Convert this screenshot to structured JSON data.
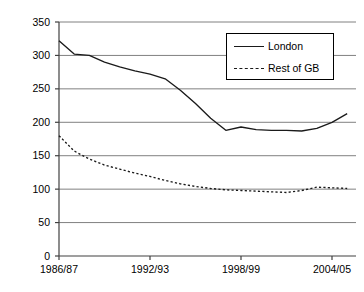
{
  "chart_data": {
    "type": "line",
    "title": "",
    "xlabel": "",
    "ylabel": "Cost per Bus Kilometre, 2006/07 prices",
    "ylim": [
      0,
      350
    ],
    "ytick_values": [
      0,
      50,
      100,
      150,
      200,
      250,
      300,
      350
    ],
    "ytick_labels": [
      "0",
      "50",
      "100",
      "150",
      "200",
      "250",
      "300",
      "350"
    ],
    "x": [
      "1986/87",
      "1987/88",
      "1988/89",
      "1989/90",
      "1990/91",
      "1991/92",
      "1992/93",
      "1993/94",
      "1994/95",
      "1995/96",
      "1996/97",
      "1997/98",
      "1998/99",
      "1999/00",
      "2000/01",
      "2001/02",
      "2002/03",
      "2003/04",
      "2004/05",
      "2005/06"
    ],
    "xtick_labels": [
      "1986/87",
      "1992/93",
      "1998/99",
      "2004/05"
    ],
    "xtick_indices": [
      0,
      6,
      12,
      18
    ],
    "grid": true,
    "grid_axis": "y",
    "legend_position": "top-right",
    "series": [
      {
        "name": "London",
        "style": "solid",
        "color": "#1a1a1a",
        "values": [
          322,
          302,
          300,
          290,
          283,
          277,
          272,
          265,
          248,
          228,
          206,
          188,
          193,
          189,
          188,
          188,
          187,
          191,
          200,
          213
        ]
      },
      {
        "name": "Rest of GB",
        "style": "dashed",
        "color": "#1a1a1a",
        "values": [
          180,
          157,
          145,
          136,
          130,
          124,
          119,
          113,
          108,
          104,
          101,
          99,
          98,
          97,
          96,
          95,
          98,
          103,
          102,
          101
        ]
      }
    ],
    "extra_points": {
      "London_end": 248,
      "Rest_of_GB_end": 102
    }
  },
  "legend": {
    "items": [
      {
        "label": "London",
        "style": "solid"
      },
      {
        "label": "Rest of GB",
        "style": "dashed"
      }
    ]
  },
  "colors": {
    "line": "#1a1a1a",
    "grid": "#808080",
    "axis": "#404040",
    "background": "#ffffff"
  }
}
